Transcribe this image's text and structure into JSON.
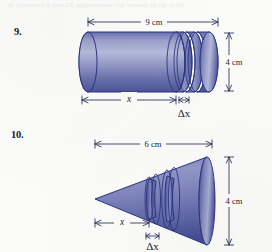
{
  "page": {
    "background_color": "#fbfbfa",
    "top_partial_text": "In Exercises 9 and 10, approximate the volume of the solid."
  },
  "colors": {
    "solid_outline": "#2b3580",
    "solid_fill_light": "#aab0d4",
    "solid_fill_mid": "#8187bd",
    "solid_fill_dark": "#4a5196",
    "endcap_light": "#b9bedb",
    "endcap_dark": "#555ca3",
    "dimension_line": "#333a5c",
    "text": "#1d1e26"
  },
  "problems": [
    {
      "number": "9.",
      "shape": "cylinder",
      "length_label": "9 cm",
      "diameter_label": "4 cm",
      "distance_label": "x",
      "slice_label": "Δx",
      "slice_count": 3
    },
    {
      "number": "10.",
      "shape": "cone",
      "length_label": "6 cm",
      "diameter_label": "4 cm",
      "distance_label": "x",
      "slice_label": "Δx",
      "slice_count": 2
    }
  ]
}
